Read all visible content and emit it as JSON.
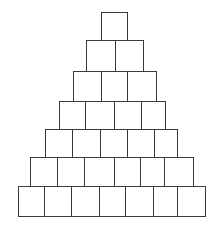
{
  "diagram": {
    "type": "pyramid-of-squares",
    "stroke_color": "#3a3a3a",
    "background": "#ffffff",
    "row_count": 7,
    "total_squares": 28,
    "rows": [
      {
        "y": 12,
        "h": 28,
        "edges": [
          101,
          127
        ]
      },
      {
        "y": 40,
        "h": 31,
        "edges": [
          86,
          115,
          143
        ]
      },
      {
        "y": 71,
        "h": 30,
        "edges": [
          73,
          101,
          127,
          156
        ]
      },
      {
        "y": 101,
        "h": 28,
        "edges": [
          59,
          85,
          114,
          141,
          165
        ]
      },
      {
        "y": 129,
        "h": 29,
        "edges": [
          45,
          72,
          100,
          127,
          154,
          177
        ]
      },
      {
        "y": 157,
        "h": 29,
        "edges": [
          30,
          57,
          84,
          114,
          140,
          164,
          193
        ]
      },
      {
        "y": 186,
        "h": 30,
        "edges": [
          18,
          44,
          71,
          99,
          125,
          153,
          177,
          205
        ]
      }
    ]
  }
}
